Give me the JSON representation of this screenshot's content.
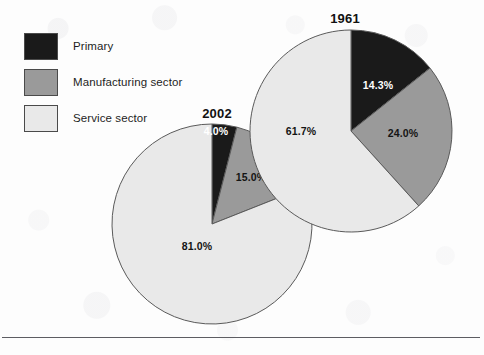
{
  "figure": {
    "background_color": "#fdfdfd",
    "rule_color": "#5d5d62"
  },
  "legend": {
    "items": [
      {
        "label": "Primary",
        "color": "#1a1a1a",
        "key": "primary"
      },
      {
        "label": "Manufacturing sector",
        "color": "#9a9a9a",
        "key": "manufacturing"
      },
      {
        "label": "Service sector",
        "color": "#e9e9e9",
        "key": "service"
      }
    ]
  },
  "charts": [
    {
      "id": "pie-1961",
      "title": "1961",
      "labels": {
        "primary": "14.3%",
        "manufacturing": "24.0%",
        "service": "61.7%"
      }
    },
    {
      "id": "pie-2002",
      "title": "2002",
      "labels": {
        "primary": "4.0%",
        "manufacturing": "15.0%",
        "service": "81.0%"
      }
    }
  ],
  "chart_data": [
    {
      "type": "pie",
      "title": "1961",
      "categories": [
        "Primary",
        "Manufacturing sector",
        "Service sector"
      ],
      "values": [
        14.3,
        24.0,
        61.7
      ],
      "value_labels": [
        "14.3%",
        "24.0%",
        "61.7%"
      ],
      "colors": [
        "#1a1a1a",
        "#9a9a9a",
        "#e9e9e9"
      ],
      "units": "percent",
      "start_angle_deg": 0,
      "direction": "clockwise",
      "legend_position": "top-left",
      "grid": false
    },
    {
      "type": "pie",
      "title": "2002",
      "categories": [
        "Primary",
        "Manufacturing sector",
        "Service sector"
      ],
      "values": [
        4.0,
        15.0,
        81.0
      ],
      "value_labels": [
        "4.0%",
        "15.0%",
        "81.0%"
      ],
      "colors": [
        "#1a1a1a",
        "#9a9a9a",
        "#e9e9e9"
      ],
      "units": "percent",
      "start_angle_deg": 0,
      "direction": "clockwise",
      "legend_position": "top-left",
      "grid": false
    }
  ]
}
